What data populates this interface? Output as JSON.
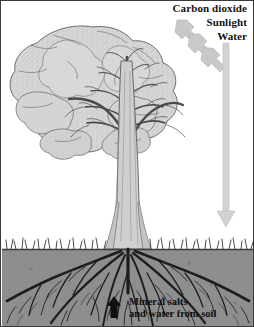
{
  "figure": {
    "background_color": "#ffffff",
    "border_color": "#3a3a3a",
    "width": 254,
    "height": 327
  },
  "inputs": {
    "heading_labels": [
      {
        "id": "carbon-dioxide",
        "text": "Carbon dioxide"
      },
      {
        "id": "sunlight",
        "text": "Sunlight"
      },
      {
        "id": "water",
        "text": "Water"
      }
    ]
  },
  "soil_uptake": {
    "line1": "Mineral salts",
    "line2": "and water from soil",
    "arrow_direction": "up",
    "arrow_color": "#101010"
  },
  "arrows": {
    "diagonal_color": "#c9c9c9",
    "diagonal_edge": "#b4b4b4",
    "diagonal_count": 3,
    "diagonal_direction": "down-left",
    "vertical_color": "#d2d2d2",
    "vertical_edge": "#c0c0c0",
    "vertical_direction": "down"
  },
  "scene": {
    "canopy_color": "#d3d3d3",
    "canopy_outline": "#5d5d5d",
    "trunk_color": "#cfcfcf",
    "trunk_outline": "#6a6a6a",
    "branch_color": "#4a4a4a",
    "soil_color": "#8e8e8e",
    "soil_top_line": "#3c3c3c",
    "root_color": "#1d1d1d",
    "grass_color": "#2b2b2b",
    "ground_line_y": 248,
    "canopy_top_y": 25,
    "canopy_left_x": 10,
    "canopy_right_x": 176
  }
}
